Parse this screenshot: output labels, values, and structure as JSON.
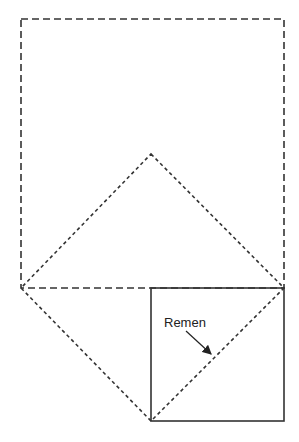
{
  "diagram": {
    "labels": {
      "strap": "Remen"
    },
    "shapes": {
      "outer_square": {
        "style": "dashed",
        "x1": 21,
        "y1": 19,
        "x2": 284,
        "y2": 288
      },
      "diamond": {
        "style": "dotted",
        "top": [
          151,
          154
        ],
        "left": [
          21,
          288
        ],
        "right": [
          284,
          288
        ],
        "bottom": [
          151,
          421
        ]
      },
      "small_square": {
        "style": "solid",
        "x1": 151,
        "y1": 288,
        "x2": 284,
        "y2": 421
      }
    },
    "colors": {
      "stroke": "#333333",
      "background": "#ffffff"
    }
  }
}
